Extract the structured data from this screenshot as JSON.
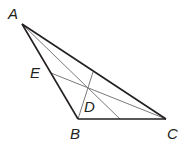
{
  "diagram": {
    "type": "triangle-cevians",
    "colors": {
      "main_stroke": "#231f20",
      "cevian_stroke": "#7a7a7a"
    },
    "points": {
      "A": {
        "label": "A",
        "x": 22,
        "y": 24,
        "lx": 8,
        "ly": 19
      },
      "B": {
        "label": "B",
        "x": 78,
        "y": 119,
        "lx": 70,
        "ly": 139
      },
      "C": {
        "label": "C",
        "x": 166,
        "y": 119,
        "lx": 167,
        "ly": 139
      },
      "D": {
        "label": "D",
        "x": 88,
        "y": 87,
        "lx": 84,
        "ly": 112
      },
      "E": {
        "label": "E",
        "x": 51,
        "y": 73,
        "lx": 30,
        "ly": 78
      }
    },
    "sides": [
      "AB",
      "BC",
      "CA"
    ],
    "cevians": [
      {
        "from": "A",
        "to_point": [
          120,
          119
        ],
        "via": "D"
      },
      {
        "from": "C",
        "to": "E",
        "via": "D"
      },
      {
        "from": "B",
        "to_point": [
          93,
          72
        ],
        "via": "D"
      }
    ]
  }
}
